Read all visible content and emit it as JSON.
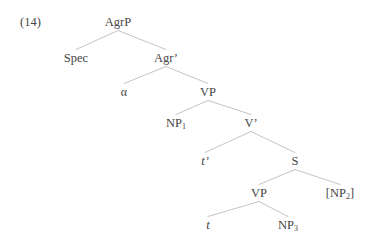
{
  "example": {
    "number": "(14)"
  },
  "tree": {
    "nodes": [
      {
        "id": "agrp",
        "label": "AgrP",
        "sub": "",
        "x": 118,
        "y": 16,
        "italic": false
      },
      {
        "id": "spec",
        "label": "Spec",
        "sub": "",
        "x": 76,
        "y": 52,
        "italic": false
      },
      {
        "id": "agrbar",
        "label": "Agr’",
        "sub": "",
        "x": 166,
        "y": 52,
        "italic": false
      },
      {
        "id": "alpha",
        "label": "α",
        "sub": "",
        "x": 124,
        "y": 86,
        "italic": false
      },
      {
        "id": "vp1",
        "label": "VP",
        "sub": "",
        "x": 208,
        "y": 86,
        "italic": false
      },
      {
        "id": "np1",
        "label": "NP",
        "sub": "1",
        "x": 176,
        "y": 117,
        "italic": false
      },
      {
        "id": "vbar",
        "label": "V’",
        "sub": "",
        "x": 251,
        "y": 117,
        "italic": false
      },
      {
        "id": "tprime",
        "label": "t’",
        "sub": "",
        "x": 205,
        "y": 155,
        "italic": true
      },
      {
        "id": "s",
        "label": "S",
        "sub": "",
        "x": 295,
        "y": 155,
        "italic": false
      },
      {
        "id": "vp2",
        "label": "VP",
        "sub": "",
        "x": 259,
        "y": 187,
        "italic": false
      },
      {
        "id": "np2",
        "label": "[NP",
        "sub": "2",
        "suffix": "]",
        "x": 340,
        "y": 187,
        "italic": false
      },
      {
        "id": "t",
        "label": "t",
        "sub": "",
        "x": 208,
        "y": 219,
        "italic": true
      },
      {
        "id": "np3",
        "label": "NP",
        "sub": "3",
        "x": 288,
        "y": 219,
        "italic": false
      }
    ],
    "edges": [
      {
        "from": "agrp",
        "to": "spec"
      },
      {
        "from": "agrp",
        "to": "agrbar"
      },
      {
        "from": "agrbar",
        "to": "alpha"
      },
      {
        "from": "agrbar",
        "to": "vp1"
      },
      {
        "from": "vp1",
        "to": "np1"
      },
      {
        "from": "vp1",
        "to": "vbar"
      },
      {
        "from": "vbar",
        "to": "tprime"
      },
      {
        "from": "vbar",
        "to": "s"
      },
      {
        "from": "s",
        "to": "vp2"
      },
      {
        "from": "s",
        "to": "np2"
      },
      {
        "from": "vp2",
        "to": "t"
      },
      {
        "from": "vp2",
        "to": "np3"
      }
    ],
    "style": {
      "line_color": "#b4b4b4",
      "line_width": 0.8,
      "text_color": "#464646",
      "background": "#ffffff"
    }
  }
}
